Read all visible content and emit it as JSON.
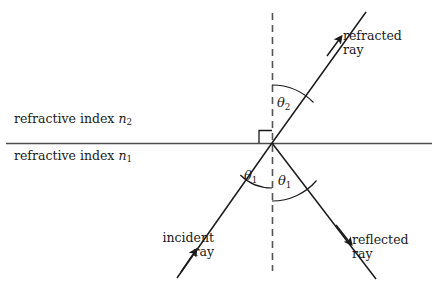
{
  "diagram": {
    "media": {
      "upper": {
        "text_prefix": "refractive index",
        "symbol": "n",
        "subscript": "2",
        "full": "refractive index n2"
      },
      "lower": {
        "text_prefix": "refractive index",
        "symbol": "n",
        "subscript": "1",
        "full": "refractive index n1"
      }
    },
    "angles": {
      "theta2": {
        "symbol": "θ",
        "subscript": "2",
        "full": "θ2"
      },
      "theta1_left": {
        "symbol": "θ",
        "subscript": "1",
        "full": "θ1"
      },
      "theta1_right": {
        "symbol": "θ",
        "subscript": "1",
        "full": "θ1"
      }
    },
    "rays": {
      "refracted": {
        "line1": "refracted",
        "line2": "ray"
      },
      "reflected": {
        "line1": "reflected",
        "line2": "ray"
      },
      "incident": {
        "line1": "incident",
        "line2": "ray"
      }
    },
    "colors": {
      "ink": "#1a1a1a",
      "interface_line": "#4d4d4d",
      "dashed_normal": "#555555",
      "background": "#ffffff"
    },
    "geometry": {
      "origin": {
        "x": 272,
        "y": 143
      },
      "interface_line": {
        "x1": 6,
        "y1": 143,
        "x2": 432,
        "y2": 143
      },
      "normal_dashed": {
        "x": 272,
        "y1": 13,
        "y2": 271
      },
      "refracted_ray": {
        "x1": 272,
        "y1": 143,
        "x2": 366,
        "y2": 12
      },
      "incident_ray": {
        "x1": 177,
        "y1": 278,
        "x2": 272,
        "y2": 143
      },
      "reflected_ray": {
        "x1": 272,
        "y1": 143,
        "x2": 376,
        "y2": 279
      },
      "right_angle_marker": {
        "x": 258,
        "y": 129,
        "size": 13
      },
      "arc_theta2_radius": 58,
      "arc_theta1_left_radius": 45,
      "arc_theta1_right_radius": 58
    }
  }
}
